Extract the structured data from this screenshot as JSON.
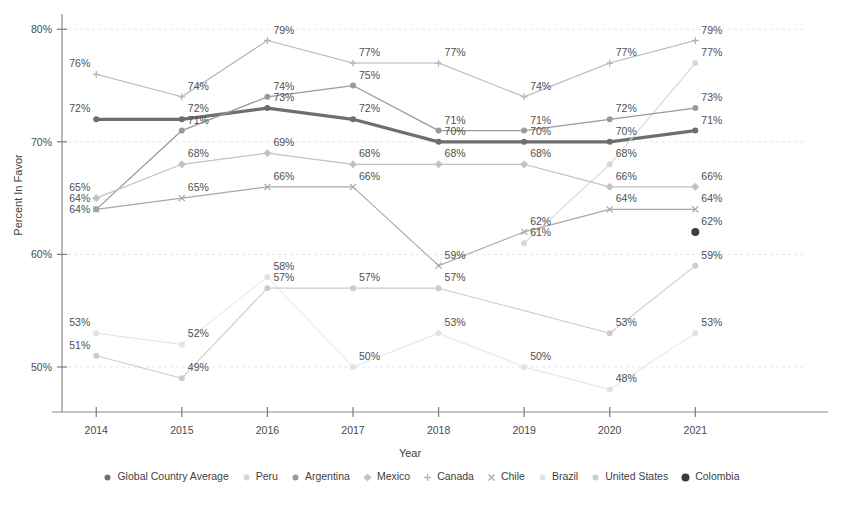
{
  "chart_data": {
    "type": "line",
    "title": "",
    "xlabel": "Year",
    "ylabel": "Percent In Favor",
    "categories": [
      "2014",
      "2015",
      "2016",
      "2017",
      "2018",
      "2019",
      "2020",
      "2021"
    ],
    "x": [
      2014,
      2015,
      2016,
      2017,
      2018,
      2019,
      2020,
      2021
    ],
    "ylim": [
      46,
      81
    ],
    "xlim": [
      2013.6,
      2022.2
    ],
    "yticks": [
      "50%",
      "60%",
      "70%",
      "80%"
    ],
    "ytick_values": [
      50,
      60,
      70,
      80
    ],
    "grid": true,
    "legend_position": "bottom",
    "series": [
      {
        "name": "Global Country Average",
        "color": "#6e6e6e",
        "marker": "circle",
        "width": 3.2,
        "values": [
          72,
          72,
          73,
          72,
          70,
          70,
          70,
          71
        ],
        "labels": [
          "72%",
          "72%",
          "73%",
          "72%",
          "70%",
          "70%",
          "70%",
          "71%"
        ]
      },
      {
        "name": "Peru",
        "color": "#d8d8d8",
        "marker": "circle",
        "width": 1.1,
        "values": [
          null,
          null,
          null,
          null,
          null,
          61,
          68,
          77
        ],
        "labels": [
          null,
          null,
          null,
          null,
          null,
          "61%",
          "68%",
          "77%"
        ]
      },
      {
        "name": "Argentina",
        "color": "#9a9a9a",
        "marker": "circle",
        "width": 1.3,
        "values": [
          64,
          71,
          74,
          75,
          71,
          71,
          72,
          73
        ],
        "labels": [
          "64%",
          "71%",
          "74%",
          "75%",
          "71%",
          "71%",
          "72%",
          "73%"
        ]
      },
      {
        "name": "Mexico",
        "color": "#c2c2c2",
        "marker": "diamond",
        "width": 1.1,
        "values": [
          65,
          68,
          69,
          68,
          68,
          68,
          66,
          66
        ],
        "labels": [
          "65%",
          "68%",
          "69%",
          "68%",
          "68%",
          "68%",
          "66%",
          "66%"
        ]
      },
      {
        "name": "Canada",
        "color": "#b4b4b4",
        "marker": "cross",
        "width": 1.1,
        "values": [
          76,
          74,
          79,
          77,
          77,
          74,
          77,
          79
        ],
        "labels": [
          "76%",
          "74%",
          "79%",
          "77%",
          "77%",
          "74%",
          "77%",
          "79%"
        ]
      },
      {
        "name": "Chile",
        "color": "#a8a8a8",
        "marker": "x",
        "width": 1.1,
        "values": [
          64,
          65,
          66,
          66,
          59,
          62,
          64,
          64
        ],
        "labels": [
          "64%",
          "65%",
          "66%",
          "66%",
          "59%",
          "62%",
          "64%",
          "64%"
        ]
      },
      {
        "name": "Brazil",
        "color": "#e2e2e2",
        "marker": "circle",
        "width": 1.0,
        "values": [
          53,
          52,
          58,
          50,
          53,
          50,
          48,
          53
        ],
        "labels": [
          "53%",
          "52%",
          "58%",
          "50%",
          "53%",
          "50%",
          "48%",
          "53%"
        ]
      },
      {
        "name": "United States",
        "color": "#cccccc",
        "marker": "circle",
        "width": 1.1,
        "values": [
          51,
          49,
          57,
          57,
          57,
          null,
          53,
          59
        ],
        "labels": [
          "51%",
          "49%",
          "57%",
          "57%",
          "57%",
          null,
          "53%",
          "59%"
        ]
      },
      {
        "name": "Colombia",
        "color": "#3d3d3d",
        "marker": "dot-only",
        "width": 0,
        "values": [
          null,
          null,
          null,
          null,
          null,
          null,
          null,
          62
        ],
        "labels": [
          null,
          null,
          null,
          null,
          null,
          null,
          null,
          "62%"
        ]
      }
    ]
  },
  "legend": {
    "items": [
      {
        "label": "Global Country Average",
        "color": "#6e6e6e"
      },
      {
        "label": "Peru",
        "color": "#d8d8d8"
      },
      {
        "label": "Argentina",
        "color": "#9a9a9a"
      },
      {
        "label": "Mexico",
        "color": "#c2c2c2"
      },
      {
        "label": "Canada",
        "color": "#b4b4b4"
      },
      {
        "label": "Chile",
        "color": "#a8a8a8"
      },
      {
        "label": "Brazil",
        "color": "#e2e2e2"
      },
      {
        "label": "United States",
        "color": "#cccccc"
      },
      {
        "label": "Colombia",
        "color": "#3d3d3d"
      }
    ]
  }
}
